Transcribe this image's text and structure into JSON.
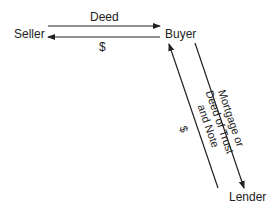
{
  "nodes": {
    "seller": "Seller",
    "buyer": "Buyer",
    "lender": "Lender"
  },
  "edges": {
    "seller_to_buyer": "Deed",
    "buyer_to_seller": "$",
    "lender_to_buyer": "$",
    "buyer_to_lender_line1": "Mortgage or",
    "buyer_to_lender_line2": "Deed of Trust",
    "buyer_to_lender_line3": "and Note"
  },
  "colors": {
    "line": "#222222",
    "text": "#222222"
  }
}
